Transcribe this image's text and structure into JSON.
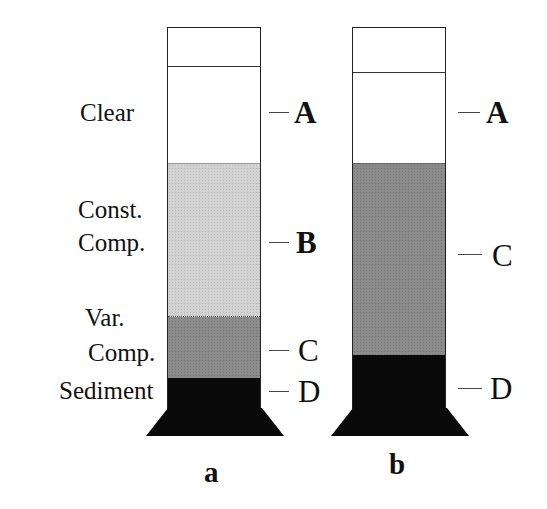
{
  "figure": {
    "columns": [
      {
        "caption": "a",
        "layers": [
          {
            "name": "headspace",
            "color": "#ffffff"
          },
          {
            "name": "Clear",
            "letter": "A",
            "color": "#ffffff"
          },
          {
            "name": "Const. Comp.",
            "letter": "B",
            "color": "#d2d2d2"
          },
          {
            "name": "Var. Comp.",
            "letter": "C",
            "color": "#8b8b8b"
          },
          {
            "name": "Sediment",
            "letter": "D",
            "color": "#0a0a0a"
          }
        ]
      },
      {
        "caption": "b",
        "layers": [
          {
            "name": "headspace",
            "color": "#ffffff"
          },
          {
            "name": "Clear",
            "letter": "A",
            "color": "#ffffff"
          },
          {
            "name": "Var. Comp.",
            "letter": "C",
            "color": "#8b8b8b"
          },
          {
            "name": "Sediment",
            "letter": "D",
            "color": "#0a0a0a"
          }
        ]
      }
    ],
    "side_labels": {
      "clear": "Clear",
      "const_line1": "Const.",
      "const_line2": "Comp.",
      "var_line1": "Var.",
      "var_line2": "Comp.",
      "sediment": "Sediment"
    }
  }
}
